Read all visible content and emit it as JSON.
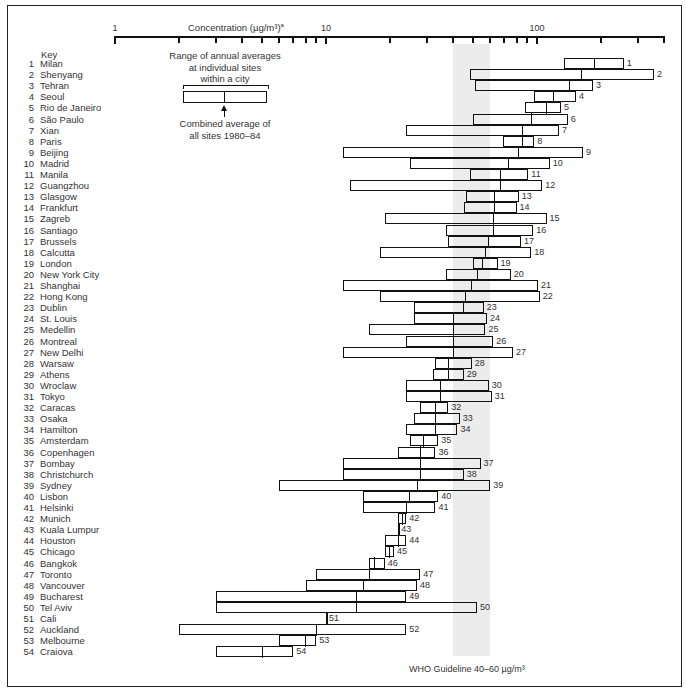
{
  "chart_data": {
    "type": "range-bar",
    "title": "Concentration (µg/m³)",
    "title_superscript": "a",
    "xlabel": "Concentration (µg/m³)",
    "xscale": "log",
    "xlim": [
      1,
      400
    ],
    "xticks_major": [
      1,
      10,
      100
    ],
    "xtick_labels": [
      "1",
      "10",
      "100"
    ],
    "xticks_minor": [
      2,
      3,
      4,
      5,
      6,
      7,
      8,
      9,
      20,
      30,
      40,
      50,
      60,
      70,
      80,
      90,
      200,
      300,
      400
    ],
    "grid": false,
    "annotation_band": {
      "label": "WHO Guideline 40–60 µg/m³",
      "from": 40,
      "to": 60,
      "color": "#ececec"
    },
    "legend": {
      "range_label_lines": [
        "Range of annual averages",
        "at individual sites",
        "within a city"
      ],
      "average_label_lines": [
        "Combined average of",
        "all sites 1980–84"
      ]
    },
    "key_title": "Key",
    "cities": [
      {
        "id": 1,
        "name": "Milan",
        "min": 134,
        "avg": 188,
        "max": 258
      },
      {
        "id": 2,
        "name": "Shenyang",
        "min": 48,
        "avg": 162,
        "max": 359
      },
      {
        "id": 3,
        "name": "Tehran",
        "min": 51,
        "avg": 143,
        "max": 184
      },
      {
        "id": 4,
        "name": "Seoul",
        "min": 97,
        "avg": 120,
        "max": 153
      },
      {
        "id": 5,
        "name": "Rio de Janeiro",
        "min": 88,
        "avg": 111,
        "max": 130
      },
      {
        "id": 6,
        "name": "São Paulo",
        "min": 50,
        "avg": 94,
        "max": 140
      },
      {
        "id": 7,
        "name": "Xian",
        "min": 24,
        "avg": 85,
        "max": 127
      },
      {
        "id": 8,
        "name": "Paris",
        "min": 69,
        "avg": 85,
        "max": 97
      },
      {
        "id": 9,
        "name": "Beijing",
        "min": 12,
        "avg": 82,
        "max": 165
      },
      {
        "id": 10,
        "name": "Madrid",
        "min": 25,
        "avg": 73,
        "max": 115
      },
      {
        "id": 11,
        "name": "Manila",
        "min": 48,
        "avg": 67,
        "max": 91
      },
      {
        "id": 12,
        "name": "Guangzhou",
        "min": 13,
        "avg": 67,
        "max": 106
      },
      {
        "id": 13,
        "name": "Glasgow",
        "min": 46,
        "avg": 63,
        "max": 82
      },
      {
        "id": 14,
        "name": "Frankfurt",
        "min": 45,
        "avg": 63,
        "max": 80
      },
      {
        "id": 15,
        "name": "Zagreb",
        "min": 19,
        "avg": 62,
        "max": 111
      },
      {
        "id": 16,
        "name": "Santiago",
        "min": 37,
        "avg": 62,
        "max": 96
      },
      {
        "id": 17,
        "name": "Brussels",
        "min": 38,
        "avg": 59,
        "max": 84
      },
      {
        "id": 18,
        "name": "Calcutta",
        "min": 18,
        "avg": 57,
        "max": 94
      },
      {
        "id": 19,
        "name": "London",
        "min": 50,
        "avg": 55,
        "max": 65
      },
      {
        "id": 20,
        "name": "New York City",
        "min": 37,
        "avg": 52,
        "max": 75
      },
      {
        "id": 21,
        "name": "Shanghai",
        "min": 12,
        "avg": 49,
        "max": 101
      },
      {
        "id": 22,
        "name": "Hong Kong",
        "min": 18,
        "avg": 46,
        "max": 103
      },
      {
        "id": 23,
        "name": "Dublin",
        "min": 26,
        "avg": 45,
        "max": 56
      },
      {
        "id": 24,
        "name": "St. Louis",
        "min": 26,
        "avg": 40,
        "max": 58
      },
      {
        "id": 25,
        "name": "Medellin",
        "min": 16,
        "avg": 40,
        "max": 57
      },
      {
        "id": 26,
        "name": "Montreal",
        "min": 24,
        "avg": 40,
        "max": 62
      },
      {
        "id": 27,
        "name": "New Delhi",
        "min": 12,
        "avg": 40,
        "max": 77
      },
      {
        "id": 28,
        "name": "Warsaw",
        "min": 33,
        "avg": 38,
        "max": 49
      },
      {
        "id": 29,
        "name": "Athens",
        "min": 32,
        "avg": 38,
        "max": 45
      },
      {
        "id": 30,
        "name": "Wroclaw",
        "min": 24,
        "avg": 35,
        "max": 59
      },
      {
        "id": 31,
        "name": "Tokyo",
        "min": 24,
        "avg": 35,
        "max": 61
      },
      {
        "id": 32,
        "name": "Caracas",
        "min": 28,
        "avg": 33,
        "max": 38
      },
      {
        "id": 33,
        "name": "Osaka",
        "min": 26,
        "avg": 33,
        "max": 43
      },
      {
        "id": 34,
        "name": "Hamilton",
        "min": 24,
        "avg": 33,
        "max": 42
      },
      {
        "id": 35,
        "name": "Amsterdam",
        "min": 25,
        "avg": 29,
        "max": 34
      },
      {
        "id": 36,
        "name": "Copenhagen",
        "min": 22,
        "avg": 28,
        "max": 33
      },
      {
        "id": 37,
        "name": "Bombay",
        "min": 12,
        "avg": 28,
        "max": 54
      },
      {
        "id": 38,
        "name": "Christchurch",
        "min": 12,
        "avg": 28,
        "max": 45
      },
      {
        "id": 39,
        "name": "Sydney",
        "min": 6,
        "avg": 27,
        "max": 60
      },
      {
        "id": 40,
        "name": "Lisbon",
        "min": 15,
        "avg": 25,
        "max": 34
      },
      {
        "id": 41,
        "name": "Helsinki",
        "min": 15,
        "avg": 24,
        "max": 33
      },
      {
        "id": 42,
        "name": "Munich",
        "min": 22,
        "avg": 23,
        "max": 24
      },
      {
        "id": 43,
        "name": "Kuala Lumpur",
        "min": 22,
        "avg": 22,
        "max": 22
      },
      {
        "id": 44,
        "name": "Houston",
        "min": 19,
        "avg": 22,
        "max": 24
      },
      {
        "id": 45,
        "name": "Chicago",
        "min": 19,
        "avg": 20,
        "max": 21
      },
      {
        "id": 46,
        "name": "Bangkok",
        "min": 16,
        "avg": 17,
        "max": 19
      },
      {
        "id": 47,
        "name": "Toronto",
        "min": 9,
        "avg": 16,
        "max": 28
      },
      {
        "id": 48,
        "name": "Vancouver",
        "min": 8,
        "avg": 15,
        "max": 27
      },
      {
        "id": 49,
        "name": "Bucharest",
        "min": 3,
        "avg": 14,
        "max": 24
      },
      {
        "id": 50,
        "name": "Tel Aviv",
        "min": 3,
        "avg": 14,
        "max": 52
      },
      {
        "id": 51,
        "name": "Cali",
        "min": 10,
        "avg": 10,
        "max": 10
      },
      {
        "id": 52,
        "name": "Auckland",
        "min": 2,
        "avg": 9,
        "max": 24
      },
      {
        "id": 53,
        "name": "Melbourne",
        "min": 6,
        "avg": 8,
        "max": 9
      },
      {
        "id": 54,
        "name": "Craiova",
        "min": 3,
        "avg": 5,
        "max": 7
      }
    ]
  }
}
